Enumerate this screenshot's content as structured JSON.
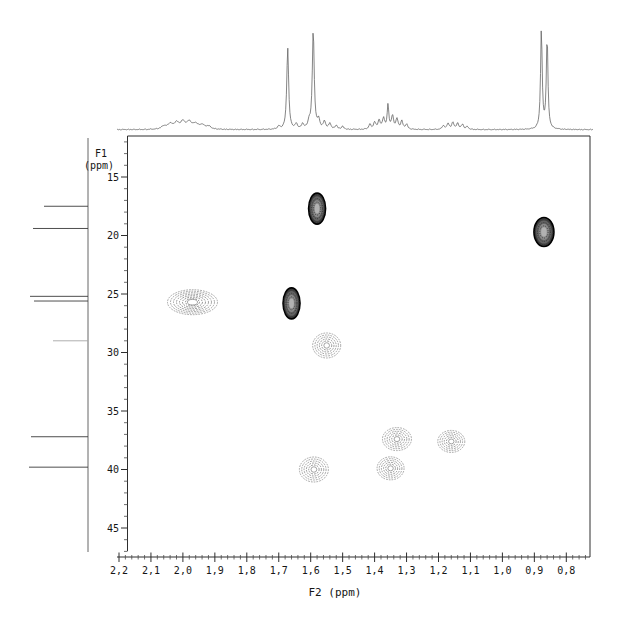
{
  "chart_data": {
    "type": "heatmap",
    "subtype": "2d-nmr-contour-plot-with-projections",
    "xlabel": "F2 (ppm)",
    "ylabel_line1": "F1",
    "ylabel_line2": "(ppm)",
    "x_axis": {
      "tick_labels": [
        "2,2",
        "2,1",
        "2,0",
        "1,9",
        "1,8",
        "1,7",
        "1,6",
        "1,5",
        "1,4",
        "1,3",
        "1,2",
        "1,1",
        "1,0",
        "0,9",
        "0,8"
      ],
      "tick_values": [
        2.2,
        2.1,
        2.0,
        1.9,
        1.8,
        1.7,
        1.6,
        1.5,
        1.4,
        1.3,
        1.2,
        1.1,
        1.0,
        0.9,
        0.8
      ],
      "range": [
        2.2,
        0.74
      ],
      "minor_step": 0.02,
      "direction": "ppm-decreasing-to-right"
    },
    "y_axis": {
      "tick_labels": [
        "15",
        "20",
        "25",
        "30",
        "35",
        "40",
        "45"
      ],
      "tick_values": [
        15,
        20,
        25,
        30,
        35,
        40,
        45
      ],
      "range": [
        11.5,
        47.5
      ],
      "minor_step": 1,
      "direction": "ppm-increasing-down"
    },
    "cross_peaks": [
      {
        "f2": 1.58,
        "f1": 17.7,
        "intensity": "strong",
        "w_px": 17,
        "h_px": 31
      },
      {
        "f2": 0.87,
        "f1": 19.7,
        "intensity": "strong",
        "w_px": 20,
        "h_px": 29
      },
      {
        "f2": 1.97,
        "f1": 25.7,
        "intensity": "weak-broad",
        "w_px": 50,
        "h_px": 25
      },
      {
        "f2": 1.66,
        "f1": 25.8,
        "intensity": "strong",
        "w_px": 17,
        "h_px": 31
      },
      {
        "f2": 1.55,
        "f1": 29.4,
        "intensity": "medium",
        "w_px": 28,
        "h_px": 25
      },
      {
        "f2": 1.33,
        "f1": 37.4,
        "intensity": "medium",
        "w_px": 29,
        "h_px": 23
      },
      {
        "f2": 1.16,
        "f1": 37.6,
        "intensity": "medium",
        "w_px": 27,
        "h_px": 22
      },
      {
        "f2": 1.59,
        "f1": 40.0,
        "intensity": "medium",
        "w_px": 29,
        "h_px": 25
      },
      {
        "f2": 1.35,
        "f1": 39.9,
        "intensity": "medium",
        "w_px": 27,
        "h_px": 23
      }
    ],
    "f2_projection_peaks_ppm_height_hwhm": [
      [
        2.06,
        3,
        0.009
      ],
      [
        2.04,
        5,
        0.009
      ],
      [
        2.02,
        6,
        0.009
      ],
      [
        2.0,
        7,
        0.009
      ],
      [
        1.98,
        7,
        0.009
      ],
      [
        1.96,
        5,
        0.009
      ],
      [
        1.94,
        4,
        0.009
      ],
      [
        1.92,
        3,
        0.009
      ],
      [
        1.7,
        3,
        0.004
      ],
      [
        1.672,
        82,
        0.0035
      ],
      [
        1.645,
        5,
        0.004
      ],
      [
        1.625,
        5,
        0.004
      ],
      [
        1.605,
        7,
        0.004
      ],
      [
        1.592,
        100,
        0.0035
      ],
      [
        1.575,
        9,
        0.004
      ],
      [
        1.557,
        8,
        0.004
      ],
      [
        1.54,
        6,
        0.004
      ],
      [
        1.52,
        4,
        0.004
      ],
      [
        1.5,
        3,
        0.004
      ],
      [
        1.415,
        5,
        0.004
      ],
      [
        1.4,
        7,
        0.004
      ],
      [
        1.386,
        9,
        0.004
      ],
      [
        1.372,
        11,
        0.004
      ],
      [
        1.358,
        24,
        0.003
      ],
      [
        1.344,
        13,
        0.004
      ],
      [
        1.33,
        10,
        0.004
      ],
      [
        1.315,
        8,
        0.004
      ],
      [
        1.3,
        5,
        0.004
      ],
      [
        1.185,
        4,
        0.004
      ],
      [
        1.17,
        6,
        0.004
      ],
      [
        1.155,
        7,
        0.004
      ],
      [
        1.14,
        6,
        0.004
      ],
      [
        1.125,
        5,
        0.004
      ],
      [
        1.11,
        3,
        0.004
      ],
      [
        0.878,
        100,
        0.003
      ],
      [
        0.86,
        92,
        0.003
      ]
    ],
    "f1_projection_peaks": [
      {
        "f1": 17.5,
        "len_px": 44,
        "shade": "dark"
      },
      {
        "f1": 19.4,
        "len_px": 55,
        "shade": "dark"
      },
      {
        "f1": 25.2,
        "len_px": 58,
        "shade": "dark"
      },
      {
        "f1": 25.6,
        "len_px": 54,
        "shade": "dark"
      },
      {
        "f1": 29.0,
        "len_px": 35,
        "shade": "light"
      },
      {
        "f1": 37.2,
        "len_px": 57,
        "shade": "dark"
      },
      {
        "f1": 39.8,
        "len_px": 59,
        "shade": "dark"
      }
    ],
    "colors": {
      "trace": "#666666",
      "axis": "#2e2e2e",
      "peak_strong": "#3f3f3f",
      "peak_light_ring": "#9a9a9a",
      "background": "#ffffff"
    }
  }
}
